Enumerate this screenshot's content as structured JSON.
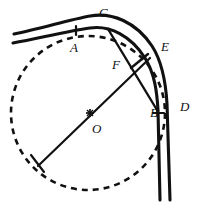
{
  "figure": {
    "background_color": "#ffffff",
    "stroke_color": "#111111",
    "labels": [
      {
        "id": "label-C",
        "text": "C",
        "x": 99,
        "y": 6,
        "describes": "apex of outer curve of the band"
      },
      {
        "id": "label-A",
        "text": "A",
        "x": 70,
        "y": 41,
        "describes": "tangent point of dashed circle on inner curve, marked by tick"
      },
      {
        "id": "label-E",
        "text": "E",
        "x": 161,
        "y": 40,
        "describes": "point on outer curve at end of perpendicular segment"
      },
      {
        "id": "label-F",
        "text": "F",
        "x": 112,
        "y": 58,
        "describes": "intersection of radius line and chord"
      },
      {
        "id": "label-D",
        "text": "D",
        "x": 180,
        "y": 100,
        "describes": "point on outer curve on the vertical leg"
      },
      {
        "id": "label-B",
        "text": "B",
        "x": 150,
        "y": 106,
        "describes": "tangent point of dashed circle on inner vertical line, marked by tick"
      },
      {
        "id": "label-O",
        "text": "O",
        "x": 92,
        "y": 122,
        "describes": "centre of the dashed circle"
      }
    ],
    "elements": {
      "outer_band_curve": "solid thick curve from upper-left running right, arcing over apex C and turning down to the vertical right leg through D",
      "inner_band_curve": "solid thick curve parallel and inside the outer curve, tangent to dashed circle at A and at B",
      "dashed_circle": "dashed circle centred at O, tangent to the inner band curve at A and B",
      "radius_line": "solid line from the lower-left point on the dashed circle through centre O up to F and on to E on the outer curve",
      "chord_line": "solid line from the inner curve near C down through F to the inner curve near B",
      "perpendicular_mark": "short solid segment from F to E indicating perpendicularity",
      "centre_mark": "small cross marking the centre O",
      "tick_A": "short tick across the inner curve at A",
      "tick_B": "short tick across the inner vertical line at B",
      "tick_lowerleft": "short tick at the lower-left end of the radius line on the dashed circle"
    }
  }
}
